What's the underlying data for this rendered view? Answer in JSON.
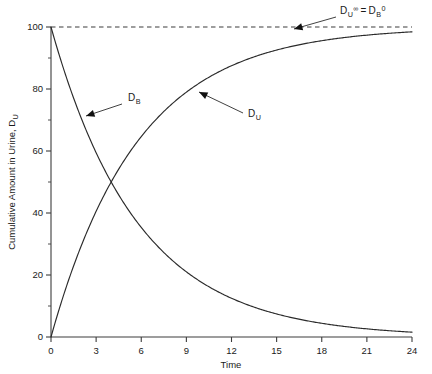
{
  "chart_data": {
    "type": "line",
    "title": "",
    "xlabel": "Time",
    "ylabel": "Cumulative Amount in Urine, D",
    "ylabel_sub": "U",
    "xlim": [
      0,
      24
    ],
    "ylim": [
      0,
      100
    ],
    "grid": false,
    "legend": "none",
    "xticks": [
      "0",
      "3",
      "6",
      "9",
      "12",
      "15",
      "18",
      "21",
      "24"
    ],
    "xtick_values": [
      0,
      3,
      6,
      9,
      12,
      15,
      18,
      21,
      24
    ],
    "yticks": [
      "0",
      "20",
      "40",
      "60",
      "80",
      "100"
    ],
    "ytick_values": [
      0,
      20,
      40,
      60,
      80,
      100
    ],
    "yminor_values": [
      10,
      30,
      50,
      70,
      90
    ],
    "decay_rate": 0.1733,
    "initial_amount": 100,
    "x": [
      0,
      1,
      2,
      3,
      4,
      5,
      6,
      7,
      8,
      9,
      10,
      11,
      12,
      13,
      14,
      15,
      16,
      17,
      18,
      19,
      20,
      21,
      22,
      23,
      24
    ],
    "series": [
      {
        "name": "D_B",
        "label": "D",
        "label_sub": "B",
        "description": "Amount of drug remaining in body",
        "color": "#2b2b2b",
        "values": [
          100,
          84.1,
          70.7,
          59.5,
          50,
          42.0,
          35.4,
          29.7,
          25,
          21.0,
          17.7,
          14.9,
          12.5,
          10.5,
          8.8,
          7.4,
          6.3,
          5.3,
          4.4,
          3.7,
          3.1,
          2.6,
          2.2,
          1.9,
          1.6
        ]
      },
      {
        "name": "D_U",
        "label": "D",
        "label_sub": "U",
        "description": "Cumulative amount of drug excreted in urine",
        "color": "#2b2b2b",
        "values": [
          0,
          15.9,
          29.3,
          40.5,
          50,
          58.0,
          64.6,
          70.3,
          75,
          79.0,
          82.3,
          85.1,
          87.5,
          89.5,
          91.2,
          92.6,
          93.7,
          94.7,
          95.6,
          96.3,
          96.9,
          97.4,
          97.8,
          98.1,
          98.4
        ]
      }
    ],
    "annotations": [
      {
        "name": "db-label",
        "label": "D",
        "sub": "B",
        "sup": "",
        "text_x": 128,
        "text_y": 101,
        "leader_from_x": 122,
        "leader_from_y": 104,
        "leader_to_x": 86,
        "leader_to_y": 116,
        "arrow_angle": 198
      },
      {
        "name": "du-label",
        "label": "D",
        "sub": "U",
        "sup": "",
        "text_x": 248,
        "text_y": 117,
        "leader_from_x": 243,
        "leader_from_y": 113,
        "leader_to_x": 199,
        "leader_to_y": 92,
        "arrow_angle": 205
      },
      {
        "name": "asymptote-label",
        "label_full": "D",
        "sub": "U",
        "sup": "∞",
        "equals": "=",
        "label2": "D",
        "sub2": "B",
        "sup2": "0",
        "text_x": 340,
        "text_y": 14,
        "leader_from_x": 336,
        "leader_from_y": 17,
        "leader_to_x": 294,
        "leader_to_y": 29,
        "arrow_angle": 196
      }
    ],
    "asymptote": {
      "value": 100,
      "style": "dashed",
      "label": "D_U^∞ = D_B^0"
    }
  }
}
